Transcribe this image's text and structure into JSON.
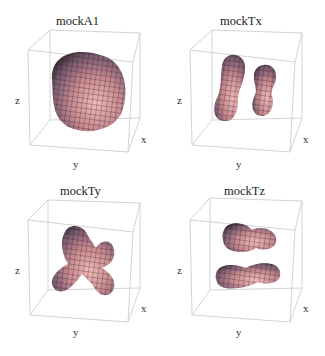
{
  "figure": {
    "panels": [
      {
        "title": "mockA1",
        "shape": "blob",
        "axes": {
          "x": "x",
          "y": "y",
          "z": "z"
        }
      },
      {
        "title": "mockTx",
        "shape": "two-vertical-lobes",
        "axes": {
          "x": "x",
          "y": "y",
          "z": "z"
        }
      },
      {
        "title": "mockTy",
        "shape": "cross-lobes",
        "axes": {
          "x": "x",
          "y": "y",
          "z": "z"
        }
      },
      {
        "title": "mockTz",
        "shape": "two-horizontal-lobes",
        "axes": {
          "x": "x",
          "y": "y",
          "z": "z"
        }
      }
    ],
    "colors": {
      "surface": "#c8898d",
      "surface_light": "#e9b4b4",
      "surface_dark": "#5a3a44",
      "mesh": "#1a1a1a",
      "box": "#c8c8c8"
    }
  }
}
